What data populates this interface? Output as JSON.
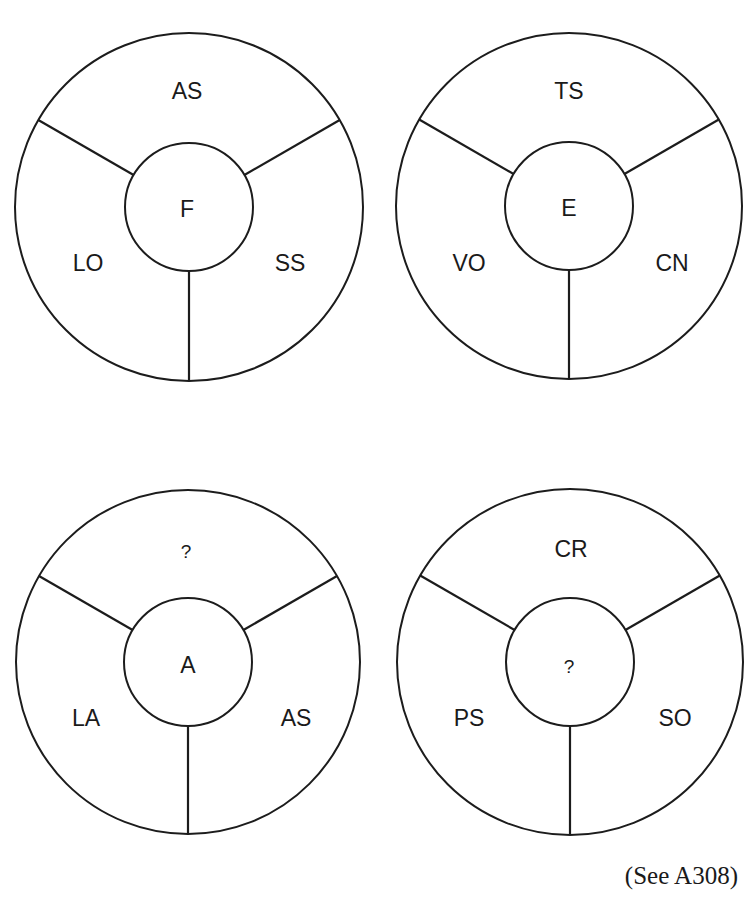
{
  "puzzle": {
    "wheels": [
      {
        "id": "top-left",
        "center": "F",
        "top": "AS",
        "left": "LO",
        "right": "SS",
        "cx": 189,
        "cy": 207,
        "r": 174,
        "ir": 64
      },
      {
        "id": "top-right",
        "center": "E",
        "top": "TS",
        "left": "VO",
        "right": "CN",
        "cx": 569,
        "cy": 206,
        "r": 173,
        "ir": 64
      },
      {
        "id": "bottom-left",
        "center": "A",
        "top": "?",
        "left": "LA",
        "right": "AS",
        "cx": 188,
        "cy": 662,
        "r": 172,
        "ir": 64
      },
      {
        "id": "bottom-right",
        "center": "?",
        "top": "CR",
        "left": "PS",
        "right": "SO",
        "cx": 570,
        "cy": 662,
        "r": 173,
        "ir": 64
      }
    ],
    "reference": "(See A308)"
  },
  "colors": {
    "stroke": "#1c1c1c",
    "text": "#1a1a1a",
    "background": "#ffffff"
  }
}
